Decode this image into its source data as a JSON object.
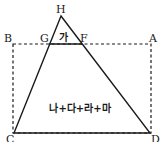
{
  "diagram": {
    "points": {
      "H": {
        "label": "H",
        "x": 61,
        "y": 16
      },
      "G": {
        "label": "G",
        "x": 49,
        "y": 44
      },
      "F": {
        "label": "F",
        "x": 82,
        "y": 44
      },
      "A": {
        "label": "A",
        "x": 151,
        "y": 44
      },
      "B": {
        "label": "B",
        "x": 13,
        "y": 44
      },
      "C": {
        "label": "C",
        "x": 14,
        "y": 133
      },
      "D": {
        "label": "D",
        "x": 150,
        "y": 133
      }
    },
    "regions": {
      "top_triangle": "가",
      "lower_region": "나+다+라+마"
    },
    "colors": {
      "stroke": "#1a1a1a",
      "background": "#ffffff"
    }
  }
}
